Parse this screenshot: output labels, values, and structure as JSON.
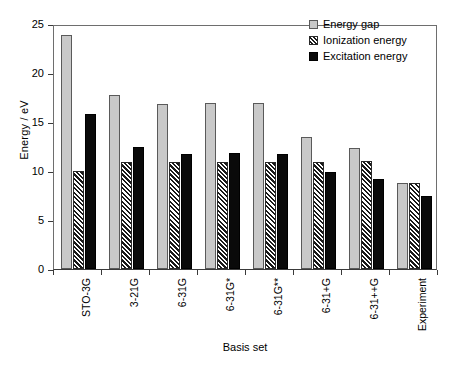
{
  "chart_data": {
    "type": "bar",
    "title": "",
    "xlabel": "Basis set",
    "ylabel": "Energy / eV",
    "ylim": [
      0,
      25
    ],
    "yticks": [
      0,
      5,
      10,
      15,
      20,
      25
    ],
    "grid": false,
    "legend_position": "top-right",
    "categories": [
      "STO-3G",
      "3-21G",
      "6-31G",
      "6-31G*",
      "6-31G**",
      "6-31+G",
      "6-31++G",
      "Experiment"
    ],
    "series": [
      {
        "name": "Energy gap",
        "color": "#c9c9c9",
        "pattern": "solid-gray",
        "values": [
          23.9,
          17.8,
          16.8,
          16.9,
          16.9,
          13.5,
          12.3,
          8.8
        ]
      },
      {
        "name": "Ionization energy",
        "color": "#ffffff",
        "pattern": "diagonal-hatch",
        "values": [
          10.0,
          10.9,
          10.9,
          10.9,
          10.9,
          10.9,
          11.0,
          8.8
        ]
      },
      {
        "name": "Excitation energy",
        "color": "#0a0a0a",
        "pattern": "solid-black",
        "values": [
          15.8,
          12.4,
          11.7,
          11.8,
          11.7,
          9.9,
          9.2,
          7.5
        ]
      }
    ]
  },
  "legend": {
    "items": [
      {
        "label": "Energy gap",
        "swatch": "gray-square-icon"
      },
      {
        "label": "Ionization energy",
        "swatch": "hatched-square-icon"
      },
      {
        "label": "Excitation energy",
        "swatch": "black-square-icon"
      }
    ]
  },
  "axes": {
    "y_title": "Energy / eV",
    "x_title": "Basis set",
    "y_tick_labels": [
      "25",
      "20",
      "15",
      "10",
      "5",
      "0"
    ],
    "x_tick_labels": [
      "STO-3G",
      "3-21G",
      "6-31G",
      "6-31G*",
      "6-31G**",
      "6-31+G",
      "6-31++G",
      "Experiment"
    ]
  }
}
